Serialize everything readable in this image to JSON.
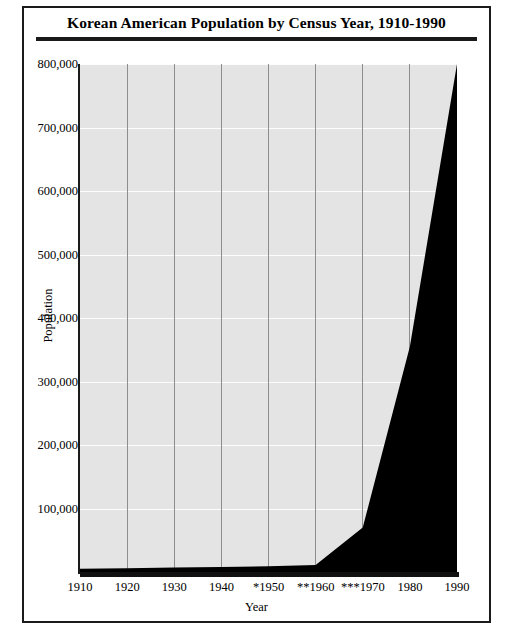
{
  "figure": {
    "title": "Korean American Population by Census Year, 1910-1990"
  },
  "chart_data": {
    "type": "area",
    "title": "Korean American Population by Census Year, 1910-1990",
    "xlabel": "Year",
    "ylabel": "Population",
    "categories": [
      "1910",
      "1920",
      "1930",
      "1940",
      "*1950",
      "**1960",
      "***1970",
      "1980",
      "1990"
    ],
    "x": [
      1910,
      1920,
      1930,
      1940,
      1950,
      1960,
      1970,
      1980,
      1990
    ],
    "values": [
      5000,
      6000,
      7000,
      8000,
      9000,
      11000,
      70000,
      355000,
      800000
    ],
    "xlim": [
      1910,
      1990
    ],
    "ylim": [
      0,
      800000
    ],
    "yticks": [
      100000,
      200000,
      300000,
      400000,
      500000,
      600000,
      700000,
      800000
    ],
    "ytick_labels": [
      "100,000",
      "200,000",
      "300,000",
      "400,000",
      "500,000",
      "600,000",
      "700,000",
      "800,000"
    ],
    "grid": true,
    "legend": false,
    "series": [
      {
        "name": "Korean American Population",
        "color": "#000000",
        "values": [
          5000,
          6000,
          7000,
          8000,
          9000,
          11000,
          70000,
          355000,
          800000
        ]
      }
    ],
    "plot_background": "#e4e4e4",
    "hgrid_color": "#fdfdfd",
    "vgrid_color": "#8d8d8d"
  }
}
